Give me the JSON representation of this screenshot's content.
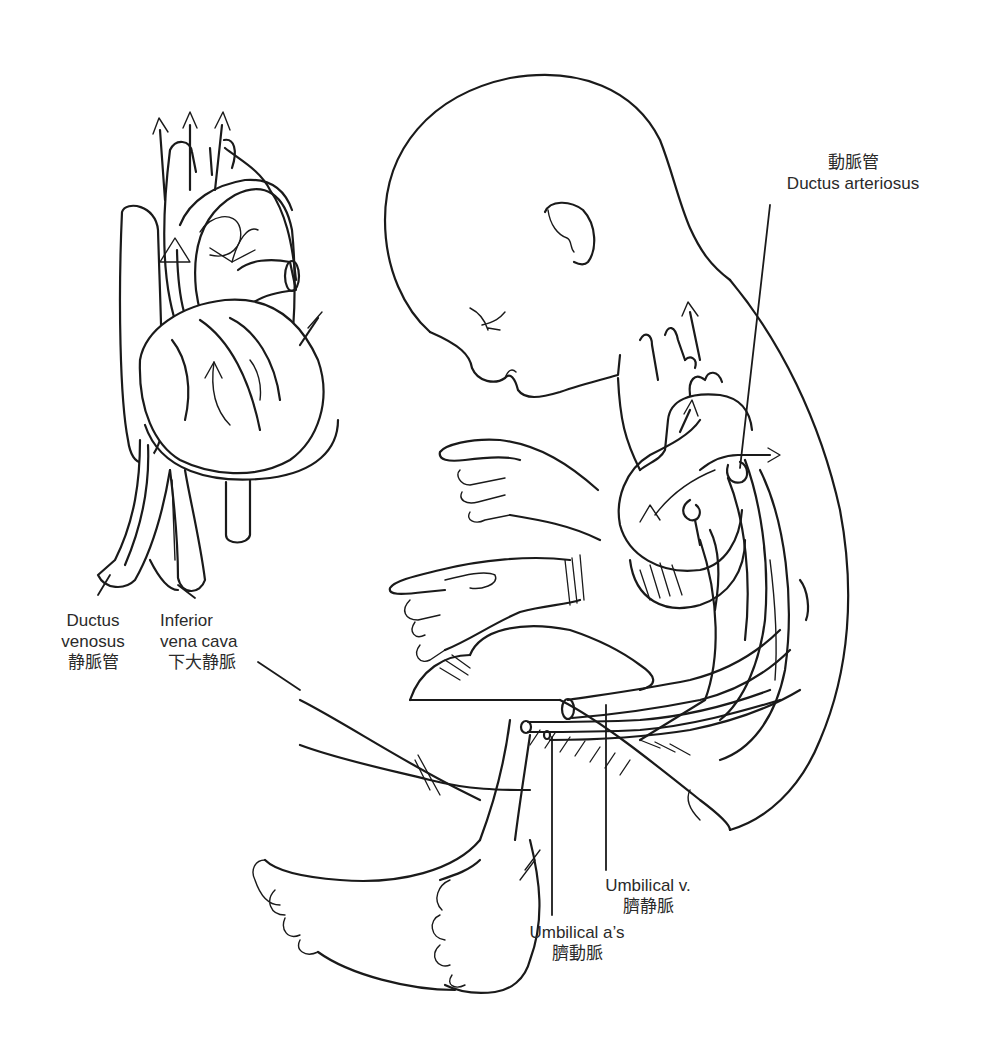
{
  "figure": {
    "labels": {
      "ductus_arteriosus": {
        "zh": "動脈管",
        "en": "Ductus arteriosus"
      },
      "ductus_venosus": {
        "en_line1": "Ductus",
        "en_line2": "venosus",
        "zh": "静脈管"
      },
      "inferior_vena_cava": {
        "en_line1": "Inferior",
        "en_line2": "vena cava",
        "zh": "下大静脈"
      },
      "umbilical_vein": {
        "en": "Umbilical v.",
        "zh": "臍静脈"
      },
      "umbilical_arteries": {
        "en": "Umbilical a’s",
        "zh": "臍動脈"
      }
    },
    "components": [
      "heart-detail-diagram",
      "fetus-outline",
      "fetal-heart",
      "umbilical-cord"
    ],
    "colors": {
      "line": "#1a1a1a",
      "text": "#2a2a2a",
      "background": "#ffffff"
    }
  }
}
